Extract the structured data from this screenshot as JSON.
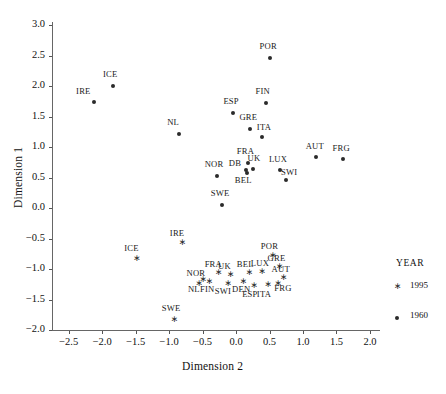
{
  "chart_data": {
    "type": "scatter",
    "title": "",
    "xlabel": "Dimension 2",
    "ylabel": "Dimension 1",
    "xlim": [
      -2.75,
      2.15
    ],
    "ylim": [
      -2.0,
      3.05
    ],
    "xticks": [
      "-2.5",
      "-2.0",
      "-1.5",
      "-1.0",
      "-0.5",
      "0.0",
      "0.5",
      "1.0",
      "1.5",
      "2.0"
    ],
    "xtick_values": [
      -2.5,
      -2.0,
      -1.5,
      -1.0,
      -0.5,
      0.0,
      0.5,
      1.0,
      1.5,
      2.0
    ],
    "yticks": [
      "3.0",
      "2.5",
      "2.0",
      "1.5",
      "1.0",
      "0.5",
      "0.0",
      "-0.5",
      "-1.0",
      "-1.5",
      "-2.0"
    ],
    "ytick_values": [
      3.0,
      2.5,
      2.0,
      1.5,
      1.0,
      0.5,
      0.0,
      -0.5,
      -1.0,
      -1.5,
      -2.0
    ],
    "grid": false,
    "legend_position": "right",
    "legend": {
      "title": "YEAR",
      "entries": [
        {
          "label": "1995",
          "marker": "star"
        },
        {
          "label": "1960",
          "marker": "dot"
        }
      ]
    },
    "series": [
      {
        "name": "1960",
        "marker": "dot",
        "points": [
          {
            "label": "IRE",
            "x": -2.13,
            "y": 1.74,
            "lx": -2.3,
            "ly": 1.9
          },
          {
            "label": "ICE",
            "x": -1.84,
            "y": 2.0,
            "lx": -1.9,
            "ly": 2.18
          },
          {
            "label": "NL",
            "x": -0.86,
            "y": 1.21,
            "lx": -0.94,
            "ly": 1.39
          },
          {
            "label": "POR",
            "x": 0.51,
            "y": 2.46,
            "lx": 0.44,
            "ly": 2.64
          },
          {
            "label": "ESP",
            "x": -0.04,
            "y": 1.56,
            "lx": -0.1,
            "ly": 1.74
          },
          {
            "label": "FIN",
            "x": 0.44,
            "y": 1.72,
            "lx": 0.38,
            "ly": 1.9
          },
          {
            "label": "GRE",
            "x": 0.21,
            "y": 1.29,
            "lx": 0.14,
            "ly": 1.47
          },
          {
            "label": "ITA",
            "x": 0.38,
            "y": 1.17,
            "lx": 0.4,
            "ly": 1.32
          },
          {
            "label": "FRA",
            "x": 0.18,
            "y": 0.74,
            "lx": 0.1,
            "ly": 0.92
          },
          {
            "label": "UK",
            "x": 0.26,
            "y": 0.64,
            "lx": 0.26,
            "ly": 0.8
          },
          {
            "label": "DB",
            "x": 0.15,
            "y": 0.63,
            "lx": -0.02,
            "ly": 0.72
          },
          {
            "label": "BEL",
            "x": 0.17,
            "y": 0.58,
            "lx": 0.07,
            "ly": 0.44
          },
          {
            "label": "NOR",
            "x": -0.28,
            "y": 0.53,
            "lx": -0.38,
            "ly": 0.7
          },
          {
            "label": "LUX",
            "x": 0.65,
            "y": 0.62,
            "lx": 0.58,
            "ly": 0.79
          },
          {
            "label": "SWI",
            "x": 0.75,
            "y": 0.46,
            "lx": 0.76,
            "ly": 0.58
          },
          {
            "label": "AUT",
            "x": 1.2,
            "y": 0.83,
            "lx": 1.13,
            "ly": 1.0
          },
          {
            "label": "FRG",
            "x": 1.6,
            "y": 0.8,
            "lx": 1.53,
            "ly": 0.97
          },
          {
            "label": "SWE",
            "x": -0.21,
            "y": 0.05,
            "lx": -0.29,
            "ly": 0.23
          }
        ]
      },
      {
        "name": "1995",
        "marker": "star",
        "points": [
          {
            "label": "IRE",
            "x": -0.81,
            "y": -0.58,
            "lx": -0.9,
            "ly": -0.42
          },
          {
            "label": "ICE",
            "x": -1.49,
            "y": -0.84,
            "lx": -1.58,
            "ly": -0.68
          },
          {
            "label": "POR",
            "x": 0.54,
            "y": -0.79,
            "lx": 0.46,
            "ly": -0.64
          },
          {
            "label": "GRE",
            "x": 0.64,
            "y": -0.97,
            "lx": 0.56,
            "ly": -0.84
          },
          {
            "label": "BEL",
            "x": 0.19,
            "y": -1.06,
            "lx": 0.1,
            "ly": -0.93
          },
          {
            "label": "LUX",
            "x": 0.38,
            "y": -1.05,
            "lx": 0.31,
            "ly": -0.92
          },
          {
            "label": "FRA",
            "x": -0.27,
            "y": -1.07,
            "lx": -0.38,
            "ly": -0.93
          },
          {
            "label": "UK",
            "x": -0.09,
            "y": -1.1,
            "lx": -0.18,
            "ly": -0.96
          },
          {
            "label": "AUT",
            "x": 0.7,
            "y": -1.14,
            "lx": 0.62,
            "ly": -1.02
          },
          {
            "label": "NOR",
            "x": -0.5,
            "y": -1.18,
            "lx": -0.65,
            "ly": -1.08
          },
          {
            "label": "NL",
            "x": -0.56,
            "y": -1.24,
            "lx": -0.63,
            "ly": -1.35
          },
          {
            "label": "FIN",
            "x": -0.41,
            "y": -1.22,
            "lx": -0.45,
            "ly": -1.34
          },
          {
            "label": "SWI",
            "x": -0.13,
            "y": -1.25,
            "lx": -0.23,
            "ly": -1.38
          },
          {
            "label": "DEN",
            "x": 0.1,
            "y": -1.22,
            "lx": 0.03,
            "ly": -1.34
          },
          {
            "label": "ESP",
            "x": 0.26,
            "y": -1.28,
            "lx": 0.18,
            "ly": -1.42
          },
          {
            "label": "ITA",
            "x": 0.47,
            "y": -1.27,
            "lx": 0.4,
            "ly": -1.42
          },
          {
            "label": "FRG",
            "x": 0.62,
            "y": -1.24,
            "lx": 0.66,
            "ly": -1.33
          },
          {
            "label": "SWE",
            "x": -0.93,
            "y": -1.83,
            "lx": -1.02,
            "ly": -1.66
          }
        ]
      }
    ]
  }
}
